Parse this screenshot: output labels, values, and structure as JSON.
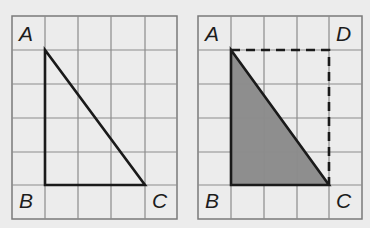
{
  "colors": {
    "background": "#ececec",
    "grid_line": "#8c8c8c",
    "grid_border": "#7a7a7a",
    "shape_stroke": "#1a1a1a",
    "shade_fill": "#8e8e8e"
  },
  "grid": {
    "columns": 5,
    "rows": 6
  },
  "figures": [
    {
      "name": "triangle-abc",
      "labels": {
        "A": "A",
        "B": "B",
        "C": "C"
      },
      "vertices": {
        "A": [
          1,
          1
        ],
        "B": [
          1,
          5
        ],
        "C": [
          4,
          5
        ]
      },
      "shaded": false
    },
    {
      "name": "triangle-abc-in-rectangle-abcd",
      "labels": {
        "A": "A",
        "B": "B",
        "C": "C",
        "D": "D"
      },
      "vertices": {
        "A": [
          1,
          1
        ],
        "B": [
          1,
          5
        ],
        "C": [
          4,
          5
        ],
        "D": [
          4,
          1
        ]
      },
      "shaded": true,
      "dashed_sides": [
        "AD",
        "DC"
      ]
    }
  ]
}
